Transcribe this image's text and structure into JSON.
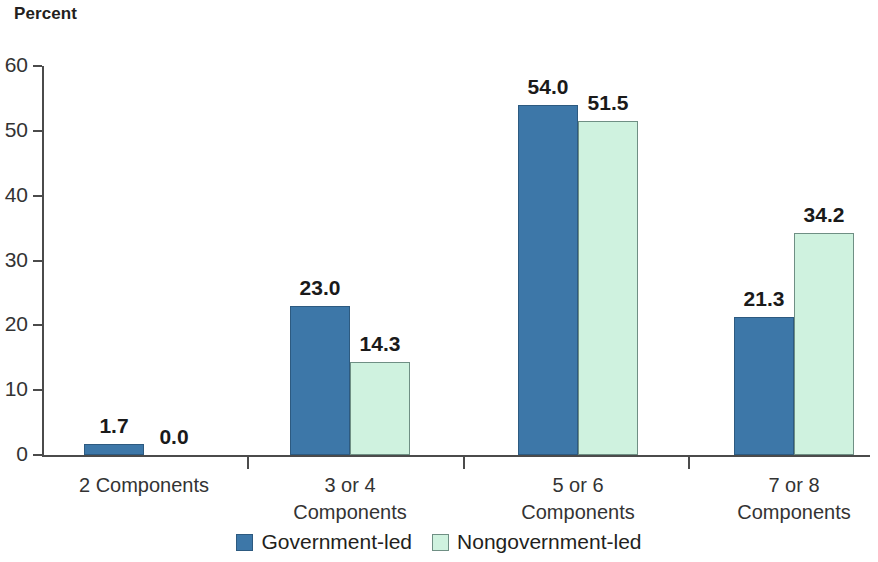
{
  "chart_data": {
    "type": "bar",
    "title": "",
    "subtitle": "",
    "xlabel": "",
    "ylabel": "Percent",
    "ylim": [
      0,
      60
    ],
    "yticks": [
      "0",
      "10",
      "20",
      "30",
      "40",
      "50",
      "60"
    ],
    "grid": false,
    "legend_position": "bottom-center",
    "categories": [
      "2 Components",
      "3 or 4\nComponents",
      "5 or 6\nComponents",
      "7 or 8\nComponents"
    ],
    "category_lines": [
      [
        "2 Components"
      ],
      [
        "3 or 4",
        "Components"
      ],
      [
        "5 or 6",
        "Components"
      ],
      [
        "7 or 8",
        "Components"
      ]
    ],
    "series": [
      {
        "name": "Government-led",
        "color": "#3d77a8",
        "values": [
          1.7,
          23.0,
          54.0,
          21.3
        ],
        "labels": [
          "1.7",
          "23.0",
          "54.0",
          "21.3"
        ]
      },
      {
        "name": "Nongovernment-led",
        "color": "#cff2df",
        "values": [
          0.0,
          14.3,
          51.5,
          34.2
        ],
        "labels": [
          "0.0",
          "14.3",
          "51.5",
          "34.2"
        ]
      }
    ]
  },
  "axis": {
    "y_title": "Percent",
    "ticks": [
      {
        "value": "60"
      },
      {
        "value": "50"
      },
      {
        "value": "40"
      },
      {
        "value": "30"
      },
      {
        "value": "20"
      },
      {
        "value": "10"
      },
      {
        "value": "0"
      }
    ]
  },
  "legend": {
    "items": [
      {
        "label": "Government-led",
        "color": "#3d77a8"
      },
      {
        "label": "Nongovernment-led",
        "color": "#cff2df"
      }
    ]
  }
}
